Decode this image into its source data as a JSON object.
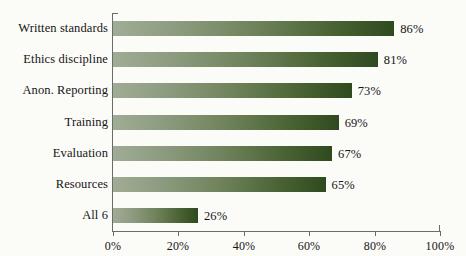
{
  "chart_data": {
    "type": "bar",
    "orientation": "horizontal",
    "title": "",
    "subtitle": "",
    "xlabel": "",
    "ylabel": "",
    "xlim": [
      0,
      100
    ],
    "grid": false,
    "legend": false,
    "categories": [
      "Written standards",
      "Ethics discipline",
      "Anon. Reporting",
      "Training",
      "Evaluation",
      "Resources",
      "All 6"
    ],
    "values": [
      86,
      81,
      73,
      69,
      67,
      65,
      26
    ],
    "value_labels": [
      "86%",
      "81%",
      "73%",
      "69%",
      "67%",
      "65%",
      "26%"
    ],
    "xticks": [
      0,
      20,
      40,
      60,
      80,
      100
    ],
    "xtick_labels": [
      "0%",
      "20%",
      "40%",
      "60%",
      "80%",
      "100%"
    ],
    "colors": {
      "bar_gradient_start": "#a0ac95",
      "bar_gradient_end": "#2f4a1f",
      "axis": "#6b6b68",
      "text": "#151515",
      "background": "#fbfbf8"
    }
  }
}
